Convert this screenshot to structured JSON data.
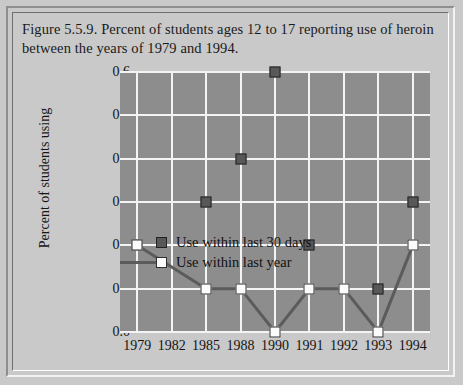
{
  "caption": "Figure 5.5.9. Percent of students ages 12 to 17 reporting use of heroin between the years of 1979 and 1994.",
  "legend": {
    "series_30days": "Use within last 30 days",
    "series_year": "Use within last year"
  },
  "colors": {
    "page_background": "#c9c9c9",
    "plot_background": "#8d8d8d",
    "gridline": "#f4f4f4",
    "marker_dark": "#58585a",
    "marker_light": "#fbfbfb",
    "line": "#5b5b5b",
    "text": "#141414"
  },
  "chart_data": {
    "type": "line",
    "title": "Figure 5.5.9. Percent of students ages 12 to 17 reporting use of heroin between the years of 1979 and 1994.",
    "xlabel": "",
    "ylabel": "Percent of students using",
    "categories": [
      "1979",
      "1982",
      "1985",
      "1988",
      "1990",
      "1991",
      "1992",
      "1993",
      "1994"
    ],
    "ylim": [
      0.0,
      0.6
    ],
    "yticks": [
      "0.0",
      "0.1",
      "0.2",
      "0.3",
      "0.4",
      "0.5",
      "0.6"
    ],
    "ytick_values": [
      0.0,
      0.1,
      0.2,
      0.3,
      0.4,
      0.5,
      0.6
    ],
    "grid": true,
    "legend_position": "inside-left",
    "series": [
      {
        "name": "Use within last 30 days",
        "marker": "dark-square",
        "connected": false,
        "values": [
          0.2,
          null,
          0.3,
          0.4,
          0.6,
          0.2,
          null,
          0.1,
          0.3
        ]
      },
      {
        "name": "Use within last year",
        "marker": "white-square",
        "connected": true,
        "values": [
          0.2,
          null,
          0.1,
          0.1,
          0.0,
          0.1,
          0.1,
          0.0,
          0.2
        ]
      }
    ]
  }
}
